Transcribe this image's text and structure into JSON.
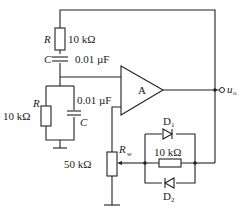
{
  "diagram": {
    "type": "circuit-schematic",
    "opamp": {
      "label": "A"
    },
    "output": {
      "label": "u",
      "subscript": "o"
    },
    "series_rc": {
      "resistor": {
        "symbol": "R",
        "value": "10 kΩ"
      },
      "capacitor": {
        "symbol": "C",
        "value": "0.01 µF"
      }
    },
    "parallel_rc": {
      "resistor": {
        "symbol": "R",
        "value": "10 kΩ"
      },
      "capacitor": {
        "symbol": "C",
        "value": "0.01 µF"
      }
    },
    "potentiometer": {
      "symbol": "R",
      "subscript": "w",
      "value": "50 kΩ"
    },
    "feedback_network": {
      "diode_top": {
        "symbol": "D",
        "subscript": "1"
      },
      "diode_bottom": {
        "symbol": "D",
        "subscript": "2"
      },
      "resistor": {
        "value": "10 kΩ"
      }
    }
  }
}
